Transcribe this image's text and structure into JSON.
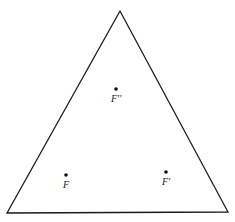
{
  "figure": {
    "type": "triangle-with-points",
    "stroke_color": "#1a1a1a",
    "background": "#ffffff",
    "triangle": {
      "vertices": [
        {
          "name": "apex",
          "x": 120,
          "y": 11
        },
        {
          "name": "bottom-left",
          "x": 7,
          "y": 213
        },
        {
          "name": "bottom-right",
          "x": 228,
          "y": 212
        }
      ]
    },
    "points": [
      {
        "id": "f-double-prime",
        "label": "F''",
        "x": 116,
        "y": 89
      },
      {
        "id": "f",
        "label": "F",
        "x": 66,
        "y": 175
      },
      {
        "id": "f-prime",
        "label": "F'",
        "x": 166,
        "y": 172
      }
    ]
  }
}
